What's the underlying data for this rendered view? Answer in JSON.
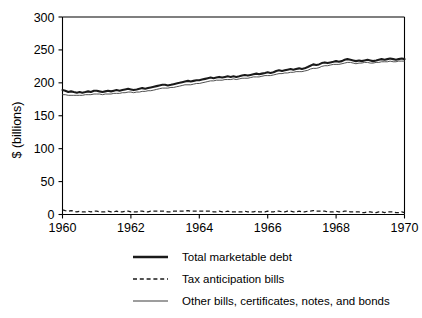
{
  "chart_data": {
    "type": "line",
    "title": "",
    "xlabel": "",
    "ylabel": "$ (billions)",
    "xlim": [
      1960,
      1970
    ],
    "ylim": [
      0,
      300
    ],
    "grid": false,
    "legend_position": "below",
    "x_ticks": [
      "1960",
      "1962",
      "1964",
      "1966",
      "1968",
      "1970"
    ],
    "x_tick_values": [
      1960,
      1962,
      1964,
      1966,
      1968,
      1970
    ],
    "y_ticks": [
      "0",
      "50",
      "100",
      "150",
      "200",
      "250",
      "300"
    ],
    "y_tick_values": [
      0,
      50,
      100,
      150,
      200,
      250,
      300
    ],
    "x": [
      1960.0,
      1960.08,
      1960.17,
      1960.25,
      1960.33,
      1960.42,
      1960.5,
      1960.58,
      1960.67,
      1960.75,
      1960.83,
      1960.92,
      1961.0,
      1961.08,
      1961.17,
      1961.25,
      1961.33,
      1961.42,
      1961.5,
      1961.58,
      1961.67,
      1961.75,
      1961.83,
      1961.92,
      1962.0,
      1962.08,
      1962.17,
      1962.25,
      1962.33,
      1962.42,
      1962.5,
      1962.58,
      1962.67,
      1962.75,
      1962.83,
      1962.92,
      1963.0,
      1963.08,
      1963.17,
      1963.25,
      1963.33,
      1963.42,
      1963.5,
      1963.58,
      1963.67,
      1963.75,
      1963.83,
      1963.92,
      1964.0,
      1964.08,
      1964.17,
      1964.25,
      1964.33,
      1964.42,
      1964.5,
      1964.58,
      1964.67,
      1964.75,
      1964.83,
      1964.92,
      1965.0,
      1965.08,
      1965.17,
      1965.25,
      1965.33,
      1965.42,
      1965.5,
      1965.58,
      1965.67,
      1965.75,
      1965.83,
      1965.92,
      1966.0,
      1966.08,
      1966.17,
      1966.25,
      1966.33,
      1966.42,
      1966.5,
      1966.58,
      1966.67,
      1966.75,
      1966.83,
      1966.92,
      1967.0,
      1967.08,
      1967.17,
      1967.25,
      1967.33,
      1967.42,
      1967.5,
      1967.58,
      1967.67,
      1967.75,
      1967.83,
      1967.92,
      1968.0,
      1968.08,
      1968.17,
      1968.25,
      1968.33,
      1968.42,
      1968.5,
      1968.58,
      1968.67,
      1968.75,
      1968.83,
      1968.92,
      1969.0,
      1969.08,
      1969.17,
      1969.25,
      1969.33,
      1969.42,
      1969.5,
      1969.58,
      1969.67,
      1969.75,
      1969.83,
      1969.92,
      1970.0
    ],
    "series": [
      {
        "name": "Total marketable debt",
        "style": "thick-solid",
        "values": [
          189,
          188,
          186,
          187,
          186,
          185,
          186,
          185,
          186,
          187,
          186,
          188,
          188,
          187,
          186,
          187,
          188,
          187,
          188,
          189,
          188,
          189,
          190,
          191,
          190,
          189,
          190,
          191,
          192,
          191,
          192,
          193,
          194,
          195,
          196,
          197,
          197,
          196,
          197,
          198,
          199,
          200,
          201,
          202,
          203,
          202,
          203,
          204,
          204,
          205,
          206,
          207,
          208,
          207,
          208,
          209,
          208,
          209,
          210,
          209,
          210,
          209,
          210,
          211,
          212,
          211,
          212,
          213,
          214,
          213,
          214,
          215,
          216,
          215,
          216,
          218,
          219,
          218,
          219,
          220,
          221,
          220,
          221,
          222,
          221,
          222,
          224,
          226,
          228,
          227,
          228,
          230,
          231,
          230,
          231,
          232,
          233,
          232,
          233,
          235,
          236,
          235,
          234,
          233,
          234,
          233,
          234,
          235,
          234,
          233,
          234,
          235,
          236,
          235,
          236,
          237,
          236,
          235,
          236,
          237,
          236
        ]
      },
      {
        "name": "Other bills, certificates, notes, and bonds",
        "style": "thin-solid",
        "values": [
          182,
          182,
          181,
          181,
          181,
          181,
          181,
          181,
          182,
          182,
          182,
          183,
          183,
          183,
          182,
          183,
          183,
          183,
          184,
          184,
          184,
          185,
          185,
          186,
          186,
          185,
          186,
          186,
          187,
          187,
          188,
          188,
          189,
          190,
          191,
          192,
          192,
          192,
          193,
          193,
          194,
          195,
          196,
          197,
          197,
          197,
          198,
          199,
          199,
          200,
          201,
          202,
          203,
          203,
          204,
          204,
          204,
          205,
          205,
          205,
          206,
          205,
          206,
          207,
          207,
          207,
          208,
          209,
          209,
          209,
          210,
          211,
          211,
          211,
          212,
          213,
          214,
          214,
          215,
          215,
          216,
          216,
          217,
          217,
          217,
          218,
          219,
          221,
          222,
          222,
          223,
          225,
          226,
          226,
          227,
          228,
          228,
          228,
          229,
          230,
          231,
          231,
          230,
          229,
          230,
          230,
          231,
          231,
          230,
          230,
          231,
          231,
          232,
          232,
          232,
          233,
          232,
          232,
          233,
          233,
          233
        ]
      },
      {
        "name": "Tax anticipation bills",
        "style": "dashed",
        "values": [
          7,
          6,
          5,
          6,
          5,
          4,
          5,
          4,
          4,
          5,
          4,
          5,
          5,
          4,
          4,
          4,
          5,
          4,
          4,
          5,
          4,
          4,
          5,
          5,
          4,
          4,
          4,
          5,
          5,
          4,
          4,
          5,
          5,
          5,
          5,
          5,
          5,
          4,
          4,
          5,
          5,
          5,
          5,
          5,
          6,
          5,
          5,
          5,
          5,
          5,
          5,
          5,
          5,
          4,
          4,
          5,
          4,
          4,
          5,
          4,
          4,
          4,
          4,
          4,
          5,
          4,
          4,
          4,
          5,
          4,
          4,
          4,
          5,
          4,
          4,
          5,
          5,
          4,
          4,
          5,
          5,
          4,
          4,
          5,
          4,
          4,
          5,
          5,
          6,
          5,
          5,
          5,
          5,
          4,
          4,
          4,
          5,
          4,
          4,
          5,
          5,
          4,
          4,
          4,
          4,
          3,
          3,
          4,
          4,
          3,
          3,
          4,
          4,
          3,
          4,
          4,
          4,
          3,
          3,
          4,
          3
        ]
      }
    ],
    "legend": [
      {
        "label": "Total marketable debt",
        "style": "thick-solid"
      },
      {
        "label": "Tax anticipation bills",
        "style": "dashed"
      },
      {
        "label": "Other bills, certificates, notes, and bonds",
        "style": "thin-solid"
      }
    ],
    "colors": {
      "total": "#1a1a1a",
      "tax": "#1a1a1a",
      "other": "#3d3d3d",
      "axis": "#000000",
      "background": "#ffffff"
    }
  }
}
